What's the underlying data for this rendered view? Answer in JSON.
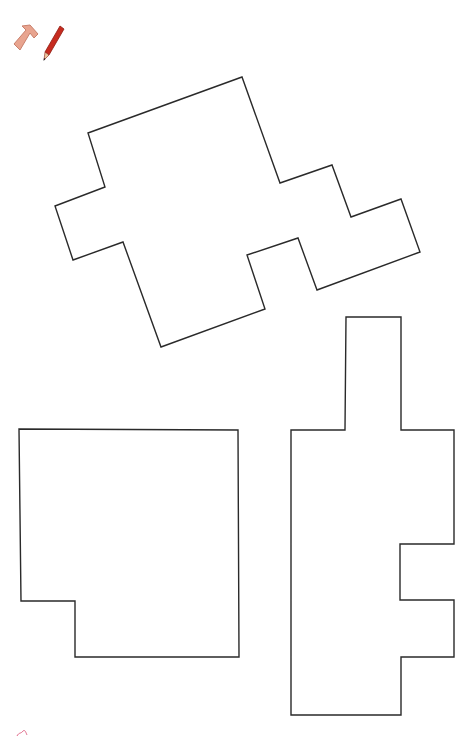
{
  "toolbar": {
    "icons": [
      {
        "name": "tetromino-piece-icon",
        "color": "#e49a86"
      },
      {
        "name": "pencil-icon",
        "color": "#c62b1f"
      }
    ]
  },
  "shapes": [
    {
      "name": "rotated-polyomino",
      "points": "88,133 242,77 280,183 332,165 351,217 401,199 420,252 317,290 298,238 247,255 265,309 161,347 123,242 73,260 55,206 105,187"
    },
    {
      "name": "notched-square",
      "points": "19,429 238,430 239,657 75,657 75,601 21,601"
    },
    {
      "name": "tall-polyomino",
      "points": "346,317 401,317 401,430 454,430 454,544 400,544 400,600 454,600 454,657 401,657 401,715 291,715 291,430 345,430"
    }
  ],
  "colors": {
    "stroke": "#2a2a2a",
    "background": "#ffffff",
    "corner_mark": "#e06a8a"
  }
}
